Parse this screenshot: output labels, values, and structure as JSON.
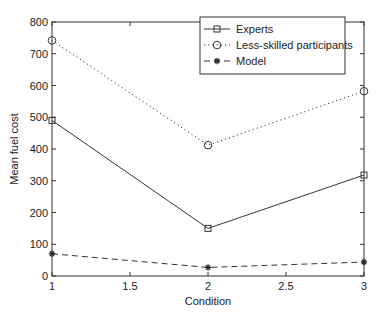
{
  "chart_data": {
    "type": "line",
    "title": "",
    "xlabel": "Condition",
    "ylabel": "Mean fuel cost",
    "x": [
      1,
      2,
      3
    ],
    "xlim": [
      1,
      3
    ],
    "ylim": [
      0,
      800
    ],
    "xticks": [
      "1",
      "1.5",
      "2",
      "2.5",
      "3"
    ],
    "yticks": [
      "0",
      "100",
      "200",
      "300",
      "400",
      "500",
      "600",
      "700",
      "800"
    ],
    "grid": false,
    "legend_position": "upper right",
    "series": [
      {
        "name": "Experts",
        "values": [
          490,
          150,
          318
        ],
        "line": "solid",
        "marker": "square"
      },
      {
        "name": "Less-skilled participants",
        "values": [
          742,
          412,
          582
        ],
        "line": "dotted",
        "marker": "circle"
      },
      {
        "name": "Model",
        "values": [
          70,
          27,
          44
        ],
        "line": "dashed",
        "marker": "star"
      }
    ]
  }
}
